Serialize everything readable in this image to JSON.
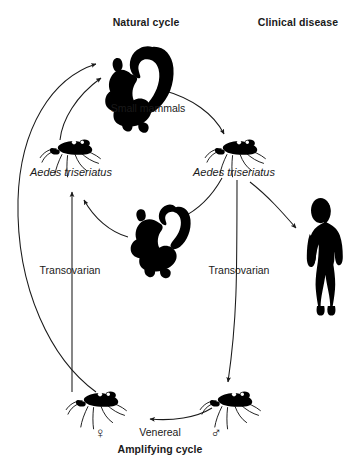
{
  "figure": {
    "headings": {
      "natural_cycle": "Natural cycle",
      "clinical_disease": "Clinical disease",
      "amplifying_cycle": "Amplifying cycle"
    },
    "labels": {
      "small_mammals": "Small mammals",
      "vector_left": "Aedes triseriatus",
      "vector_right": "Aedes triseriatus",
      "transovarian_left": "Transovarian",
      "transovarian_right": "Transovarian",
      "venereal": "Venereal",
      "female_symbol": "♀",
      "male_symbol": "♂"
    },
    "colors": {
      "ink": "#1a1a1a",
      "silhouette": "#000000",
      "background": "#ffffff",
      "stroke": "#1a1a1a"
    },
    "nodes": [
      {
        "id": "squirrel-top",
        "icon": "squirrel-icon",
        "label": "Small mammals"
      },
      {
        "id": "chipmunk-center",
        "icon": "chipmunk-icon",
        "label": ""
      },
      {
        "id": "mosquito-left",
        "icon": "mosquito-icon",
        "label": "Aedes triseriatus"
      },
      {
        "id": "mosquito-right",
        "icon": "mosquito-icon",
        "label": "Aedes triseriatus"
      },
      {
        "id": "mosquito-female",
        "icon": "mosquito-icon",
        "label": "♀"
      },
      {
        "id": "mosquito-male",
        "icon": "mosquito-icon",
        "label": "♂"
      },
      {
        "id": "human",
        "icon": "human-icon",
        "label": "Clinical disease"
      }
    ],
    "edges": [
      {
        "from": "mosquito-female",
        "to": "squirrel-top",
        "label": ""
      },
      {
        "from": "mosquito-left",
        "to": "squirrel-top",
        "label": ""
      },
      {
        "from": "squirrel-top",
        "to": "mosquito-right",
        "label": ""
      },
      {
        "from": "mosquito-right",
        "to": "chipmunk-center",
        "label": ""
      },
      {
        "from": "chipmunk-center",
        "to": "mosquito-left",
        "label": ""
      },
      {
        "from": "mosquito-female",
        "to": "mosquito-left",
        "label": "Transovarian"
      },
      {
        "from": "mosquito-right",
        "to": "mosquito-male",
        "label": "Transovarian"
      },
      {
        "from": "mosquito-male",
        "to": "mosquito-female",
        "label": "Venereal"
      },
      {
        "from": "mosquito-right",
        "to": "human",
        "label": ""
      }
    ]
  }
}
